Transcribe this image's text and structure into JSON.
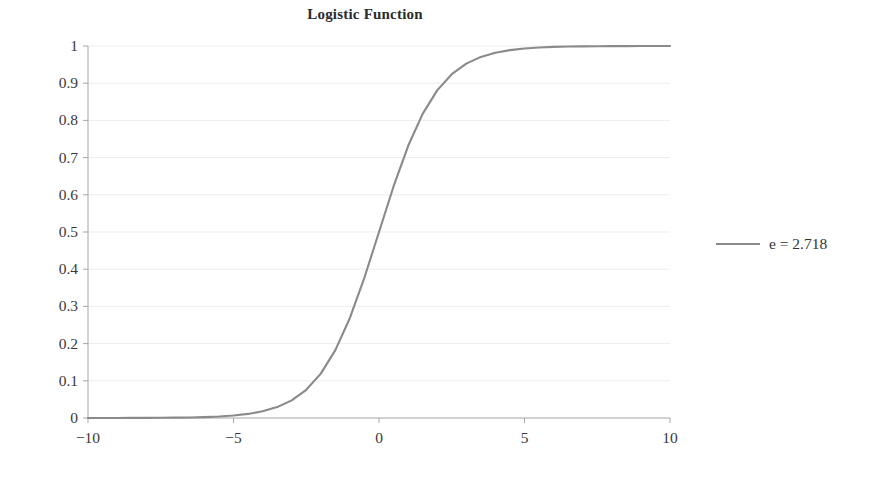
{
  "chart_data": {
    "type": "line",
    "title": "Logistic Function",
    "xlabel": "",
    "ylabel": "",
    "xlim": [
      -10,
      10
    ],
    "ylim": [
      0,
      1
    ],
    "grid": true,
    "grid_axis": "y",
    "legend_position": "right",
    "x_ticks": [
      -10,
      -5,
      0,
      5,
      10
    ],
    "x_tick_labels": [
      "−10",
      "−5",
      "0",
      "5",
      "10"
    ],
    "y_ticks": [
      0,
      0.1,
      0.2,
      0.3,
      0.4,
      0.5,
      0.6,
      0.7,
      0.8,
      0.9,
      1
    ],
    "y_tick_labels": [
      "0",
      "0.1",
      "0.2",
      "0.3",
      "0.4",
      "0.5",
      "0.6",
      "0.7",
      "0.8",
      "0.9",
      "1"
    ],
    "series": [
      {
        "name": "e = 2.718",
        "color": "#8a8a8a",
        "x": [
          -10,
          -9.5,
          -9,
          -8.5,
          -8,
          -7.5,
          -7,
          -6.5,
          -6,
          -5.5,
          -5,
          -4.5,
          -4,
          -3.5,
          -3,
          -2.5,
          -2,
          -1.5,
          -1,
          -0.5,
          0,
          0.5,
          1,
          1.5,
          2,
          2.5,
          3,
          3.5,
          4,
          4.5,
          5,
          5.5,
          6,
          6.5,
          7,
          7.5,
          8,
          8.5,
          9,
          9.5,
          10
        ],
        "values": [
          4.54e-05,
          7.49e-05,
          0.0001234,
          0.0002035,
          0.0003354,
          0.0005527,
          0.0009111,
          0.0015012,
          0.0024726,
          0.00407,
          0.0066929,
          0.0109869,
          0.0179862,
          0.0293122,
          0.0474259,
          0.0758582,
          0.1192029,
          0.1824255,
          0.2689414,
          0.3775407,
          0.5,
          0.6224593,
          0.7310586,
          0.8175745,
          0.8807971,
          0.9241418,
          0.9525741,
          0.9706878,
          0.9820138,
          0.9890131,
          0.9933071,
          0.99593,
          0.9975274,
          0.9984988,
          0.9990889,
          0.9994473,
          0.9996646,
          0.9997965,
          0.9998766,
          0.9999251,
          0.9999546
        ]
      }
    ],
    "legend_entries": [
      {
        "label": "e = 2.718",
        "color": "#8a8a8a"
      }
    ],
    "colors": {
      "curve": "#8a8a8a",
      "axis": "#a6a6a6",
      "gridline": "#ededed",
      "text": "#3a3a3a",
      "background": "#ffffff"
    }
  }
}
